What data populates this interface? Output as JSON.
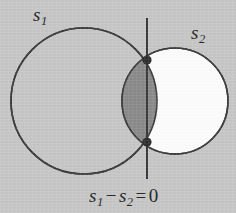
{
  "figure": {
    "name": "two-circle-venn-intersection-diagram",
    "background_color": "#c7c7c7",
    "stroke_color": "#3a3a3a",
    "labels": {
      "left_circle": {
        "base": "s",
        "subscript": "1",
        "full_text": "s1"
      },
      "right_circle": {
        "base": "s",
        "subscript": "2",
        "full_text": "s2"
      },
      "equation": {
        "term1_base": "s",
        "term1_sub": "1",
        "operator": "−",
        "term2_base": "s",
        "term2_sub": "2",
        "equals": "=",
        "value": "0",
        "full_text": "s1 − s2 = 0"
      }
    },
    "shapes": {
      "left_circle": {
        "label": "s1",
        "cx": 84,
        "cy": 101,
        "r": 73,
        "fill": "#c7c7c7",
        "fill_description": "unfilled (background gray)",
        "stroke": "#3a3a3a",
        "stroke_width": 1.6
      },
      "right_circle": {
        "label": "s2",
        "cx": 175,
        "cy": 101,
        "r": 53,
        "fill": "#fdfdfd",
        "fill_description": "white",
        "stroke": "#3a3a3a",
        "stroke_width": 1.6
      },
      "intersection_lens": {
        "fill": "#8a8a8a",
        "fill_description": "dark gray overlap region",
        "stroke": "#3a3a3a"
      },
      "vertical_line": {
        "x": 147,
        "y_top": 18,
        "y_bottom": 179,
        "stroke": "#3a3a3a",
        "stroke_width": 2
      },
      "intersection_points": [
        {
          "cx": 147,
          "cy": 60,
          "r": 4.6,
          "fill": "#2e2e2e"
        },
        {
          "cx": 147,
          "cy": 142,
          "r": 4.6,
          "fill": "#2e2e2e"
        }
      ]
    }
  }
}
